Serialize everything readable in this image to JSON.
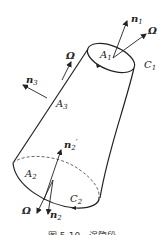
{
  "figure": {
    "labels": {
      "n1": "n",
      "n1_sub": "1",
      "omega_top": "Ω",
      "A1": "A",
      "A1_sub": "1",
      "C1": "C",
      "C1_sub": "1",
      "omega_side": "Ω",
      "n3": "n",
      "n3_sub": "3",
      "A3": "A",
      "A3_sub": "3",
      "n2prime": "n",
      "n2prime_sub": "2",
      "n2prime_mark": "′",
      "A2": "A",
      "A2_sub": "2",
      "C2": "C",
      "C2_sub": "2",
      "omega_bottom": "Ω",
      "n2": "n",
      "n2_sub": "2"
    },
    "caption": "图 5-10　涡管段",
    "colors": {
      "stroke": "#222222",
      "dashed": "#555555",
      "background": "#ffffff"
    }
  }
}
